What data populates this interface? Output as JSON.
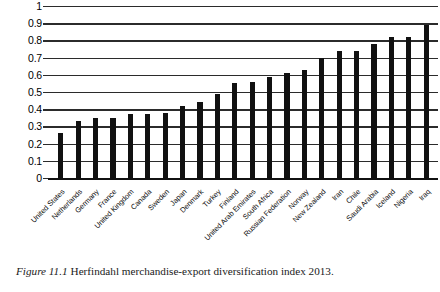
{
  "caption": {
    "figure_number": "Figure 11.1",
    "text": "Herfindahl merchandise-export diversification index 2013."
  },
  "chart_data": {
    "type": "bar",
    "title": "",
    "xlabel": "",
    "ylabel": "",
    "ylim": [
      0,
      1
    ],
    "grid": true,
    "legend": null,
    "orientation": "vertical",
    "bar_color": "#111111",
    "gridline_color": "#2b2b2b",
    "y_ticks": [
      "1",
      "0.9",
      "0.8",
      "0.7",
      "0.6",
      "0.5",
      "0.4",
      "0.3",
      "0.2",
      "0.1",
      "0"
    ],
    "y_tick_values": [
      1,
      0.9,
      0.8,
      0.7,
      0.6,
      0.5,
      0.4,
      0.3,
      0.2,
      0.1,
      0
    ],
    "categories": [
      "United States",
      "Netherlands",
      "Germany",
      "France",
      "United Kingdom",
      "Canada",
      "Sweden",
      "Japan",
      "Denmark",
      "Turkey",
      "Finland",
      "United Arab Emirates",
      "South Africa",
      "Russian Federation",
      "Norway",
      "New Zealand",
      "Iran",
      "Chile",
      "Saudi Arabia",
      "Iceland",
      "Nigeria",
      "Iraq"
    ],
    "values": [
      0.26,
      0.33,
      0.35,
      0.35,
      0.37,
      0.37,
      0.38,
      0.42,
      0.44,
      0.49,
      0.55,
      0.56,
      0.59,
      0.61,
      0.63,
      0.7,
      0.74,
      0.74,
      0.78,
      0.82,
      0.82,
      0.89
    ]
  }
}
